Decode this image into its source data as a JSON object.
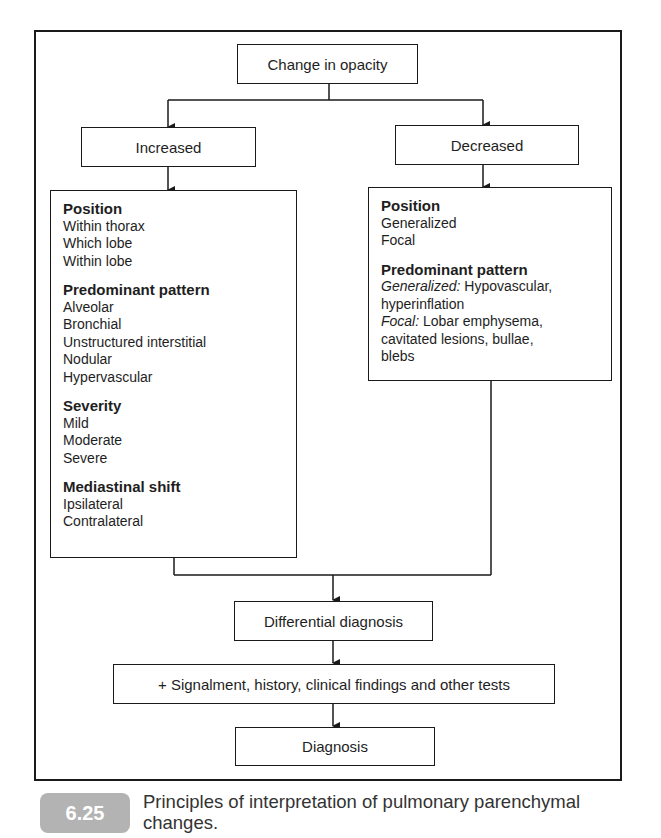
{
  "figure": {
    "root": "Change in opacity",
    "branches": {
      "increased": {
        "label": "Increased",
        "sections": [
          {
            "title": "Position",
            "items": [
              "Within thorax",
              "Which lobe",
              "Within lobe"
            ]
          },
          {
            "title": "Predominant pattern",
            "items": [
              "Alveolar",
              "Bronchial",
              "Unstructured interstitial",
              "Nodular",
              "Hypervascular"
            ]
          },
          {
            "title": "Severity",
            "items": [
              "Mild",
              "Moderate",
              "Severe"
            ]
          },
          {
            "title": "Mediastinal shift",
            "items": [
              "Ipsilateral",
              "Contralateral"
            ]
          }
        ]
      },
      "decreased": {
        "label": "Decreased",
        "sections": [
          {
            "title": "Position",
            "items": [
              "Generalized",
              "Focal"
            ]
          },
          {
            "title": "Predominant pattern",
            "lines": [
              {
                "italic": "Generalized:",
                "text": " Hypovascular,"
              },
              {
                "italic": "",
                "text": "hyperinflation"
              },
              {
                "italic": "Focal:",
                "text": " Lobar emphysema,"
              },
              {
                "italic": "",
                "text": "cavitated lesions, bullae,"
              },
              {
                "italic": "",
                "text": "blebs"
              }
            ]
          }
        ]
      }
    },
    "differential": "Differential diagnosis",
    "signalment": "+ Signalment, history, clinical findings and other tests",
    "diagnosis": "Diagnosis"
  },
  "caption": {
    "number": "6.25",
    "text": "Principles of interpretation of pulmonary parenchymal changes."
  }
}
